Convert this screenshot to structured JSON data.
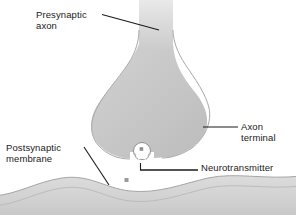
{
  "figure": {
    "background_color": "#ffffff",
    "line_color": "#1a1a1a",
    "text_color": "#1a1a1a"
  },
  "labels": {
    "presynaptic_axon": "Presynaptic\naxon",
    "axon_terminal": "Axon\nterminal",
    "postsynaptic_membrane": "Postsynaptic\nmembrane",
    "neurotransmitter": "Neurotransmitter"
  },
  "structures": {
    "axon_shaft": {
      "name": "presynaptic-axon-shaft",
      "fill": "#d6d6d6"
    },
    "axon_terminal_bulb": {
      "name": "axon-terminal-bulb",
      "fill": "#c9c9c9",
      "outline": "#9a9a9a"
    },
    "synaptic_vesicle": {
      "name": "synaptic-vesicle",
      "fill": "#ffffff",
      "outline": "#8a8a8a"
    },
    "neurotransmitter_particle_in_vesicle": {
      "name": "neurotransmitter-particle",
      "fill": "#9a9a9a"
    },
    "neurotransmitter_particle_in_cleft": {
      "name": "neurotransmitter-particle-released",
      "fill": "#9a9a9a"
    },
    "postsynaptic_membrane_band": {
      "name": "postsynaptic-membrane-band",
      "fill": "#d2d2d2",
      "outline": "#a5a5a5"
    },
    "synaptic_cleft": {
      "name": "synaptic-cleft",
      "fill": "#ffffff"
    }
  },
  "leader_lines": [
    {
      "name": "leader-presynaptic-axon",
      "from": [
        102,
        14
      ],
      "to": [
        159,
        30
      ]
    },
    {
      "name": "leader-axon-terminal",
      "from": [
        203,
        127
      ],
      "to": [
        238,
        127
      ]
    },
    {
      "name": "leader-postsynaptic-membrane",
      "from": [
        84,
        147
      ],
      "to": [
        109,
        185
      ]
    },
    {
      "name": "leader-neurotransmitter",
      "from": [
        140,
        170
      ],
      "to": [
        198,
        170
      ]
    }
  ]
}
